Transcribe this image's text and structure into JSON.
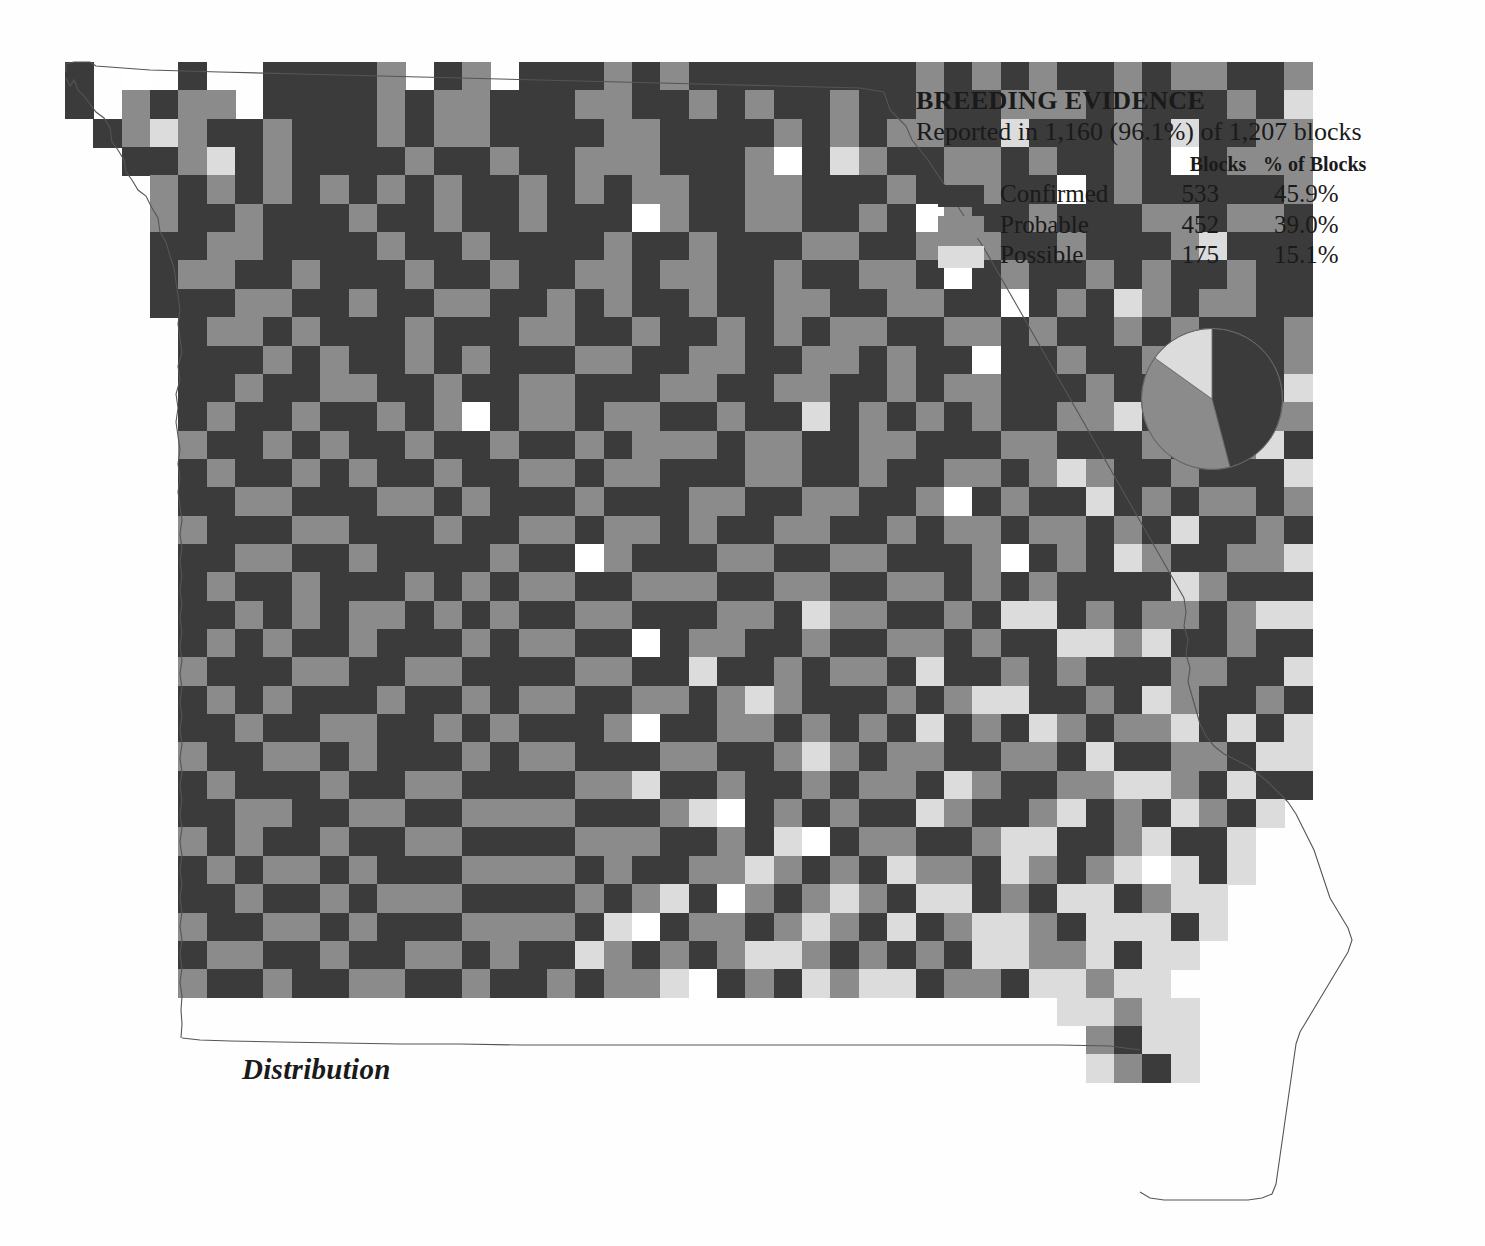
{
  "legend": {
    "title": "BREEDING EVIDENCE",
    "subtitle": "Reported in 1,160 (96.1%) of 1,207 blocks",
    "columns": {
      "swatch": "",
      "category": "",
      "blocks": "Blocks",
      "percent": "% of Blocks"
    },
    "rows": [
      {
        "label": "Confirmed",
        "blocks": "533",
        "percent": "45.9%",
        "color": "#3b3b3b"
      },
      {
        "label": "Probable",
        "blocks": "452",
        "percent": "39.0%",
        "color": "#8b8b8b"
      },
      {
        "label": "Possible",
        "blocks": "175",
        "percent": "15.1%",
        "color": "#dcdcdc"
      }
    ]
  },
  "caption": {
    "text": "Distribution"
  },
  "chart_data": {
    "type": "pie",
    "title": "BREEDING EVIDENCE",
    "subtitle": "Reported in 1,160 (96.1%) of 1,207 blocks",
    "categories": [
      "Confirmed",
      "Probable",
      "Possible"
    ],
    "values": [
      533,
      452,
      175
    ],
    "percents": [
      45.9,
      39.0,
      15.1
    ],
    "colors": [
      "#3b3b3b",
      "#8b8b8b",
      "#dcdcdc"
    ],
    "total_reported": 1160,
    "total_blocks": 1207,
    "reported_percent": 96.1,
    "legend_position": "top-right",
    "start_angle_deg": 0,
    "direction": "clockwise"
  },
  "map": {
    "type": "block-grid-choropleth",
    "region": "Missouri",
    "cell_width": 28.35,
    "cell_height": 28.35,
    "origin_x": 65,
    "origin_y": 62,
    "palette": {
      "1": "#3b3b3b",
      "2": "#8b8b8b",
      "3": "#dcdcdc",
      "4": "#ffffff",
      "0": "none"
    },
    "legend_keys": {
      "1": "Confirmed",
      "2": "Probable",
      "3": "Possible",
      "4": "Not reported"
    },
    "rows": [
      "1040100111120120111212111111112121211212211200000000",
      "1021220111121221112211212112112112221211121300000000",
      "0123211211121221111221111212122113111213112200000000",
      "0011231211112112112221112413211221211214122200000000",
      "0002121212121211212122112211121221141211111200000000",
      "0002112111211211211142112211214211211122122100000000",
      "0001122111121121111211211122112221121112311100000000",
      "0001221121112112112212211211221412112121121100000000",
      "0001112211211221121211211221122114121321221100000000",
      "0000122121112111221121121212211221211212111200000000",
      "0000111212112121112211221122121141121121121200000000",
      "0000112112211211221112211221121221112112211300000000",
      "0000121121121241221221121131212121122311112200000000",
      "0000211212112112112122212211221112211121123100000000",
      "0000121121211211221221112211211221232112111300000000",
      "0000112211122121112111221122112412113121221200000000",
      "0000211122111211221221211221121221221213112100000000",
      "0000112211211112114211122112211124121321122300000000",
      "0000121121112121221122211221122121211113211100000000",
      "0000112121221212112211122132211213312122123300000000",
      "0000121211211121221141221121122121133231121100000000",
      "0000211122112211112211311212213112121112211300000000",
      "0000121211121121221122123211121233112132112100000000",
      "0000112112211212111241122121213121321223131300000000",
      "0000211221211121221112211232122112213112213300000000",
      "0000121112112211112231121121221321122332131100000000",
      "0000112211221122221112341212113211231213213000000000",
      "0000212112112211112221121341221123311231130000000000",
      "0000121221211122221211223212132213212343130000000000",
      "0000112112122211112123142123213312133123300000000000",
      "0000211221211122221341221232131233213331300000000000",
      "0000122112112212113212123321212133223133000000000000",
      "0000211211221121121223412132331221332330000000000000",
      "0000000000000000000000000000000000033233000000000000",
      "0000000000000000000000000000000000002133000000000000",
      "0000000000000000000000000000000000003213000000000000"
    ]
  }
}
